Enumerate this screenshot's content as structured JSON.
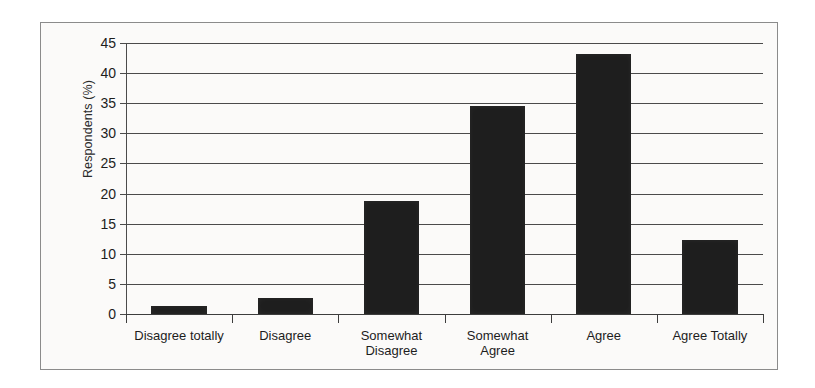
{
  "chart_data": {
    "type": "bar",
    "title": "",
    "xlabel": "",
    "ylabel": "Respondents (%)",
    "categories": [
      "Disagree totally",
      "Disagree",
      "Somewhat\nDisagree",
      "Somewhat\nAgree",
      "Agree",
      "Agree Totally"
    ],
    "values": [
      1.3,
      2.7,
      18.8,
      34.5,
      43.2,
      12.3
    ],
    "ylim": [
      0,
      45
    ],
    "yticks": [
      0,
      5,
      10,
      15,
      20,
      25,
      30,
      35,
      40,
      45
    ],
    "ytick_labels": [
      "0",
      "5",
      "10",
      "15",
      "20",
      "25",
      "30",
      "35",
      "40",
      "45"
    ],
    "grid": true,
    "legend": false,
    "bar_color": "#1e1e1e",
    "plot_background": "#fbfaf9",
    "axis_color": "#4b4b4b"
  }
}
